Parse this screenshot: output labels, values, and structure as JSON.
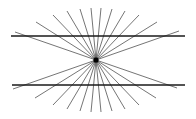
{
  "figure": {
    "width": 196,
    "height": 119,
    "background": "#ffffff",
    "center": {
      "x": 96,
      "y": 60
    },
    "center_dot_radius": 2.6,
    "ray_color": "#3a3a3a",
    "ray_width": 0.7,
    "line_color": "#1a1a1a",
    "line_width": 1.6,
    "horizontal_lines": [
      {
        "x1": 11,
        "x2": 185,
        "y": 36
      },
      {
        "x1": 12,
        "x2": 185,
        "y": 85
      }
    ],
    "ray_endpoints_top": [
      [
        15,
        32
      ],
      [
        36,
        22
      ],
      [
        53,
        15
      ],
      [
        67,
        11
      ],
      [
        80,
        9
      ],
      [
        91,
        8
      ],
      [
        101,
        8
      ],
      [
        112,
        9
      ],
      [
        125,
        11
      ],
      [
        139,
        15
      ],
      [
        157,
        22
      ],
      [
        179,
        31
      ]
    ]
  }
}
